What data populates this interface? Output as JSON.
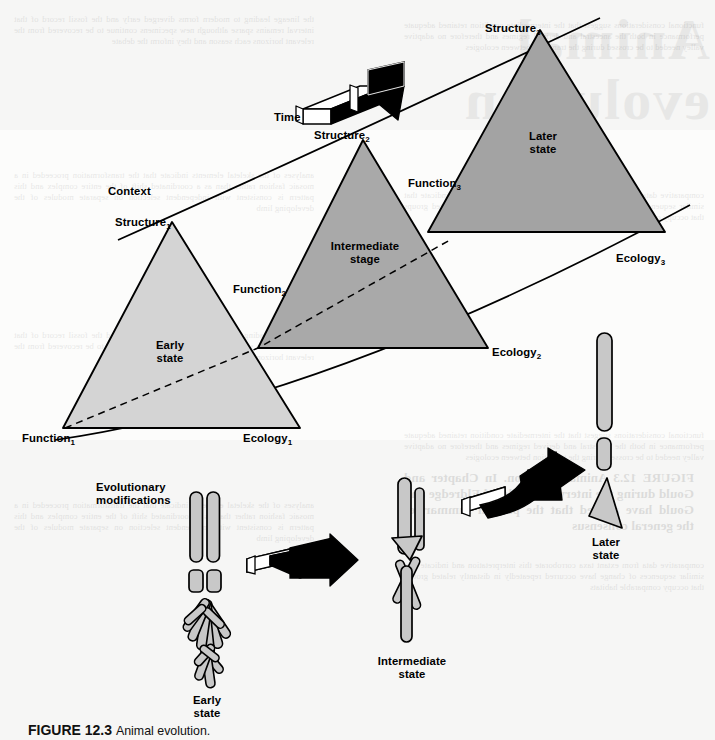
{
  "figure": {
    "caption_number": "FIGURE 12.3",
    "caption_text": "Animal evolution.",
    "background_note": "scanned textbook page with faint show-through text"
  },
  "top_diagram": {
    "name": "structure-function-ecology-triangles",
    "axis_labels": {
      "time": "Time",
      "context": "Context"
    },
    "states": [
      {
        "id": "early",
        "center_label_line1": "Early",
        "center_label_line2": "state",
        "structure": "Structure",
        "structure_sub": "1",
        "function": "Function",
        "function_sub": "1",
        "ecology": "Ecology",
        "ecology_sub": "1",
        "fill": "#d4d4d4"
      },
      {
        "id": "intermediate",
        "center_label_line1": "Intermediate",
        "center_label_line2": "stage",
        "structure": "Structure",
        "structure_sub": "2",
        "function": "Function",
        "function_sub": "2",
        "ecology": "Ecology",
        "ecology_sub": "2",
        "fill": "#a9a9a9"
      },
      {
        "id": "later",
        "center_label_line1": "Later",
        "center_label_line2": "state",
        "structure": "Structure",
        "structure_sub": "3",
        "function": "Function",
        "function_sub": "3",
        "ecology": "Ecology",
        "ecology_sub": "3",
        "fill": "#a3a3a3"
      }
    ]
  },
  "bottom_diagram": {
    "name": "limb-skeleton-evolution-sequence",
    "annotation": {
      "line1": "Evolutionary",
      "line2": "modifications"
    },
    "stages": [
      {
        "id": "early",
        "label_line1": "Early",
        "label_line2": "state"
      },
      {
        "id": "intermediate",
        "label_line1": "Intermediate",
        "label_line2": "state"
      },
      {
        "id": "later",
        "label_line1": "Later",
        "label_line2": "state"
      }
    ],
    "bone_fill": "#c8c8c8",
    "arrow_fill": "#000000"
  },
  "colors": {
    "page_background": "#fcfcfb",
    "line": "#000000",
    "early_fill": "#d4d4d4",
    "intermediate_fill": "#a9a9a9",
    "later_fill": "#a3a3a3",
    "bone_fill": "#c8c8c8"
  },
  "bleed_text": {
    "col_left_1": "the lineage leading to modern forms diverged early and the fossil record of that interval remains sparse although new specimens continue to be recovered from the relevant horizons each season and they inform the debate",
    "col_left_2": "analyses of the skeletal elements indicate that the transformation proceeded in a mosaic fashion rather than as a coordinated shift of the entire complex and this pattern is consistent with independent selection on separate modules of the developing limb",
    "col_right_1": "functional considerations suggest that the intermediate condition retained adequate performance in both the ancestral and derived regimes and therefore no adaptive valley needed to be crossed during the transition between ecologies",
    "col_right_2": "comparative data from extant taxa corroborate this interpretation and indicate that similar sequences of change have occurred repeatedly in distantly related groups that occupy comparable habitats",
    "big_1": "Animal evolution",
    "big_2": "FIGURE 12.3 Animal evolution. In Chapter and Gould during the interval considered Eldredge and Gould have argued that the pattern summarizes the general consensus"
  }
}
